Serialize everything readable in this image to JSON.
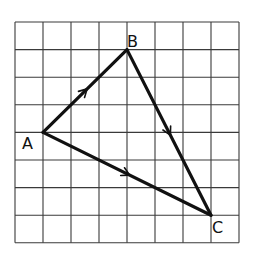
{
  "diagram": {
    "type": "vector-triangle-on-grid",
    "grid": {
      "columns": 8,
      "rows": 8,
      "origin_px": [
        15,
        22
      ],
      "cell_w": 28,
      "cell_h": 27.6,
      "line_color": "#3a3a3a"
    },
    "points": [
      {
        "name": "A",
        "label": "A",
        "grid": [
          1,
          4
        ],
        "label_pos": [
          22,
          149
        ]
      },
      {
        "name": "B",
        "label": "B",
        "grid": [
          4,
          1
        ],
        "label_pos": [
          127,
          47
        ]
      },
      {
        "name": "C",
        "label": "C",
        "grid": [
          7,
          7
        ],
        "label_pos": [
          212,
          233
        ]
      }
    ],
    "edges": [
      {
        "from": "A",
        "to": "B",
        "arrow": true
      },
      {
        "from": "B",
        "to": "C",
        "arrow": true
      },
      {
        "from": "A",
        "to": "C",
        "arrow": true
      }
    ],
    "stroke_color": "#111111"
  }
}
